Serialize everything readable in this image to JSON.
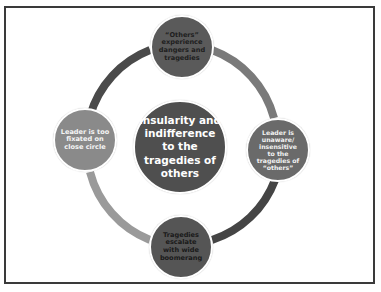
{
  "diagram": {
    "type": "cycle",
    "center": {
      "label": "Insularity and\nindifference\nto  the\ntragedies of\nothers",
      "fill": "#4f4f4f",
      "text_color": "#ffffff"
    },
    "nodes": [
      {
        "id": "top",
        "label": "“Others”\nexperience\ndangers and\ntragedies",
        "fill": "#5a5a5a",
        "text_color": "#1e1e1e"
      },
      {
        "id": "right",
        "label": "Leader is\nunaware/\ninsensitive\nto the\ntragedies of\n“others”",
        "fill": "#6a6a6a",
        "text_color": "#f2f2f2"
      },
      {
        "id": "bottom",
        "label": "Tragedies\nescalate\nwith wide\nboomerang",
        "fill": "#555555",
        "text_color": "#1a1a1a"
      },
      {
        "id": "left",
        "label": "Leader is too\nfixated on\nclose circle",
        "fill": "#8a8a8a",
        "text_color": "#f4f4f4"
      }
    ],
    "arcs": [
      {
        "from": "left",
        "to": "top",
        "color": "#4a4a4a"
      },
      {
        "from": "top",
        "to": "right",
        "color": "#7a7a7a"
      },
      {
        "from": "right",
        "to": "bottom",
        "color": "#454545"
      },
      {
        "from": "bottom",
        "to": "left",
        "color": "#9a9a9a"
      }
    ],
    "frame_border_color": "#3a3a3a"
  }
}
